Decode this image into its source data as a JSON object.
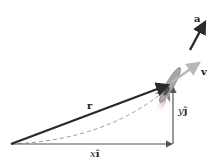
{
  "diagram": {
    "labels": {
      "acceleration": "a",
      "velocity": "v",
      "position": "r",
      "y_component_var": "y",
      "y_component_unit": "ĵ",
      "x_component_var": "x",
      "x_component_unit": "î"
    },
    "colors": {
      "position_vector": "#2a2a2a",
      "acceleration_vector": "#2a2a2a",
      "velocity_vector": "#b8b8b8",
      "components": "#555555",
      "path_dashed": "#9a9a9a",
      "rocket_body": "#a0a0a0"
    }
  }
}
